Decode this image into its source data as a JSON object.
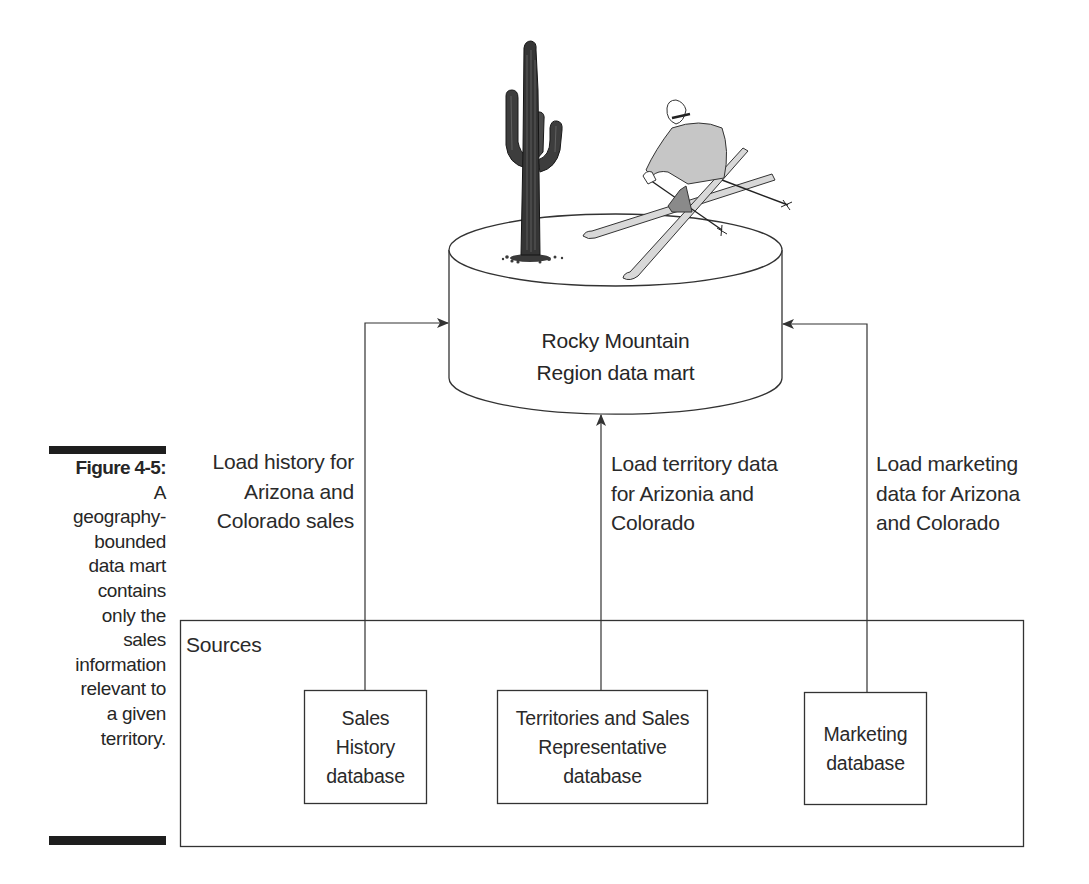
{
  "figure": {
    "label": "Figure 4-5:",
    "caption_lines": [
      "A",
      "geography-",
      "bounded",
      "data mart",
      "contains",
      "only the",
      "sales",
      "information",
      "relevant to",
      "a given",
      "territory."
    ]
  },
  "data_mart": {
    "title_lines": [
      "Rocky Mountain",
      "Region data mart"
    ],
    "shape": "cylinder",
    "illustrations": [
      "saguaro-cactus-icon",
      "skier-icon"
    ]
  },
  "flows": [
    {
      "id": "sales-history-flow",
      "label_lines": [
        "Load history for",
        "Arizona and",
        "Colorado sales"
      ]
    },
    {
      "id": "territory-flow",
      "label_lines": [
        "Load territory data",
        "for Arizonia and",
        "Colorado"
      ]
    },
    {
      "id": "marketing-flow",
      "label_lines": [
        "Load marketing",
        "data for Arizona",
        "and Colorado"
      ]
    }
  ],
  "sources": {
    "title": "Sources",
    "boxes": [
      {
        "lines": [
          "Sales",
          "History",
          "database"
        ]
      },
      {
        "lines": [
          "Territories and Sales",
          "Representative",
          "database"
        ]
      },
      {
        "lines": [
          "Marketing",
          "database"
        ]
      }
    ]
  },
  "colors": {
    "line": "#333333",
    "bar": "#1e1e1e",
    "skier_suit": "#c8c8c8",
    "cactus": "#3a3a3a"
  }
}
